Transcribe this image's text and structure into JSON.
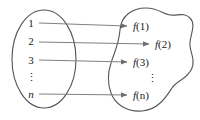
{
  "figure": {
    "type": "function-mapping-diagram",
    "colors": {
      "background": "#ffffff",
      "outline": "#555555",
      "arrow": "#808080",
      "text": "#1a1a1a"
    },
    "domain_set": {
      "shape": "ellipse",
      "elements": [
        {
          "label": "1",
          "italic": false,
          "x": 31,
          "y": 23
        },
        {
          "label": "2",
          "italic": false,
          "x": 31,
          "y": 41
        },
        {
          "label": "3",
          "italic": false,
          "x": 31,
          "y": 60
        },
        {
          "label": "⋮",
          "italic": false,
          "x": 31,
          "y": 77
        },
        {
          "label": "n",
          "italic": true,
          "x": 31,
          "y": 94
        }
      ]
    },
    "range_set": {
      "shape": "blob",
      "elements": [
        {
          "func": "f",
          "arg": "1",
          "x": 133,
          "y": 26
        },
        {
          "func": "f",
          "arg": "2",
          "x": 155,
          "y": 44
        },
        {
          "func": "f",
          "arg": "3",
          "x": 133,
          "y": 62
        },
        {
          "func": "⋮",
          "arg": "",
          "x": 152,
          "y": 78
        },
        {
          "func": "f",
          "arg": "n",
          "x": 133,
          "y": 95
        }
      ]
    },
    "arrows": [
      {
        "name": "arrow-1-to-f1",
        "x1": 39,
        "y1": 23,
        "x2": 128,
        "y2": 26
      },
      {
        "name": "arrow-2-to-f2",
        "x1": 39,
        "y1": 42,
        "x2": 150,
        "y2": 44
      },
      {
        "name": "arrow-3-to-f3",
        "x1": 39,
        "y1": 60,
        "x2": 128,
        "y2": 62
      },
      {
        "name": "arrow-n-to-fn",
        "x1": 39,
        "y1": 94,
        "x2": 128,
        "y2": 95
      }
    ]
  }
}
